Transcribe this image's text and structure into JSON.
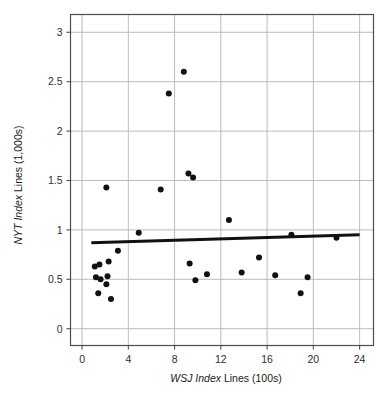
{
  "chart_data": {
    "type": "scatter",
    "title": "",
    "xlabel": "WSJ Index Lines (100s)",
    "ylabel": "NYT Index Lines (1,000s)",
    "xlabel_parts": {
      "lead_italic": "WSJ",
      "mid_italic": "Index",
      "tail": " Lines (100s)"
    },
    "ylabel_parts": {
      "lead_italic": "NYT",
      "mid_italic": "Index",
      "tail": " Lines (1,000s)"
    },
    "xlim": [
      -1,
      25.2
    ],
    "ylim": [
      -0.17,
      3.18
    ],
    "xticks": [
      0,
      4,
      8,
      12,
      16,
      20,
      24
    ],
    "yticks": [
      0,
      0.5,
      1,
      1.5,
      2,
      2.5,
      3
    ],
    "xtick_labels": [
      "0",
      "4",
      "8",
      "12",
      "16",
      "20",
      "24"
    ],
    "ytick_labels": [
      "0",
      "0.5",
      "1",
      "1.5",
      "2",
      "2.5",
      "3"
    ],
    "grid": true,
    "grid_color": "#b4b4b4",
    "frame_color": "#4d4d4d",
    "marker_color": "#111111",
    "marker_size": 3.0,
    "legend": "none",
    "points": [
      {
        "x": 1.1,
        "y": 0.63
      },
      {
        "x": 1.5,
        "y": 0.65
      },
      {
        "x": 1.2,
        "y": 0.52
      },
      {
        "x": 1.6,
        "y": 0.5
      },
      {
        "x": 1.4,
        "y": 0.36
      },
      {
        "x": 2.1,
        "y": 1.43
      },
      {
        "x": 2.3,
        "y": 0.68
      },
      {
        "x": 2.2,
        "y": 0.53
      },
      {
        "x": 2.1,
        "y": 0.45
      },
      {
        "x": 2.5,
        "y": 0.3
      },
      {
        "x": 3.1,
        "y": 0.79
      },
      {
        "x": 4.9,
        "y": 0.97
      },
      {
        "x": 6.8,
        "y": 1.41
      },
      {
        "x": 7.5,
        "y": 2.38
      },
      {
        "x": 8.8,
        "y": 2.6
      },
      {
        "x": 9.2,
        "y": 1.57
      },
      {
        "x": 9.3,
        "y": 0.66
      },
      {
        "x": 9.6,
        "y": 1.53
      },
      {
        "x": 9.8,
        "y": 0.49
      },
      {
        "x": 10.8,
        "y": 0.55
      },
      {
        "x": 12.7,
        "y": 1.1
      },
      {
        "x": 13.8,
        "y": 0.57
      },
      {
        "x": 15.3,
        "y": 0.72
      },
      {
        "x": 16.7,
        "y": 0.54
      },
      {
        "x": 18.1,
        "y": 0.95
      },
      {
        "x": 18.9,
        "y": 0.36
      },
      {
        "x": 19.5,
        "y": 0.52
      },
      {
        "x": 22.0,
        "y": 0.92
      }
    ],
    "trendline": {
      "label": "linear fit",
      "x_start": 0.8,
      "y_start": 0.871,
      "x_end": 24.0,
      "y_end": 0.952,
      "color": "#111111",
      "width": 3.0
    }
  }
}
